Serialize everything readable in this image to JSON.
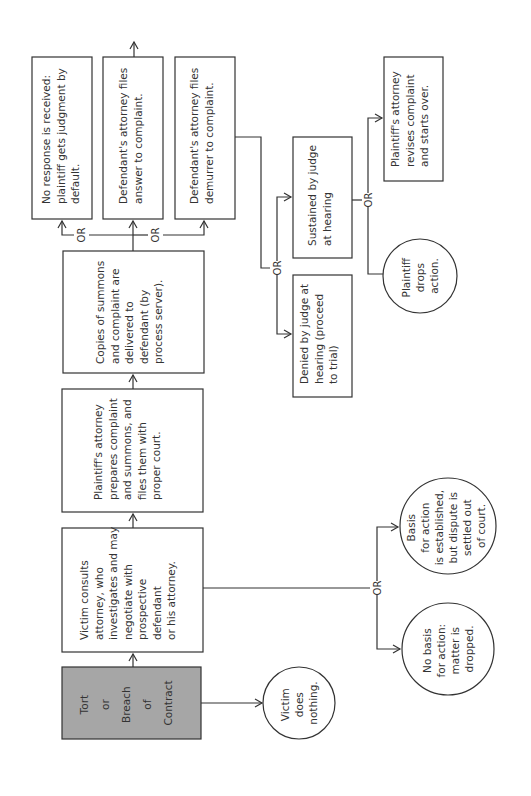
{
  "diagram": {
    "orientation": "rotated 90 degrees counter-clockwise",
    "colors": {
      "line": "#333333",
      "start_fill": "#a6a6a6",
      "box_fill": "#ffffff"
    },
    "or_label": "OR",
    "nodes": {
      "start": {
        "lines": [
          "Tort",
          "or",
          "Breach",
          "of",
          "Contract"
        ]
      },
      "victim_nothing": {
        "lines": [
          "Victim",
          "does",
          "nothing."
        ]
      },
      "consult": {
        "lines": [
          "Victim consults",
          "attorney, who",
          "investigates and may",
          "negotiate with",
          "prospective",
          "defendant",
          "or his attorney."
        ]
      },
      "no_basis": {
        "lines": [
          "No basis",
          "for action:",
          "matter is",
          "dropped."
        ]
      },
      "settled": {
        "lines": [
          "Basis",
          "for action",
          "is established,",
          "but dispute is",
          "settled out",
          "of court."
        ]
      },
      "prepares": {
        "lines": [
          "Plaintiff's attorney",
          "prepares complaint",
          "and summons, and",
          "files them with",
          "proper court."
        ]
      },
      "served": {
        "lines": [
          "Copies of summons",
          "and complaint are",
          "delivered to",
          "defendant (by",
          "process server)."
        ]
      },
      "default": {
        "lines": [
          "No response is received:",
          "plaintiff gets judgment by",
          "default."
        ]
      },
      "answer": {
        "lines": [
          "Defendant's attorney files",
          "answer to complaint."
        ]
      },
      "demurrer": {
        "lines": [
          "Defendant's attorney files",
          "demurrer to complaint."
        ]
      },
      "denied": {
        "lines": [
          "Denied by judge at",
          "hearing (proceed",
          "to trial)"
        ]
      },
      "sustained": {
        "lines": [
          "Sustained by judge",
          "at hearing"
        ]
      },
      "drops": {
        "lines": [
          "Plaintiff",
          "drops",
          "action."
        ]
      },
      "revises": {
        "lines": [
          "Plaintiff's attorney",
          "revises complaint",
          "and starts over."
        ]
      }
    }
  }
}
